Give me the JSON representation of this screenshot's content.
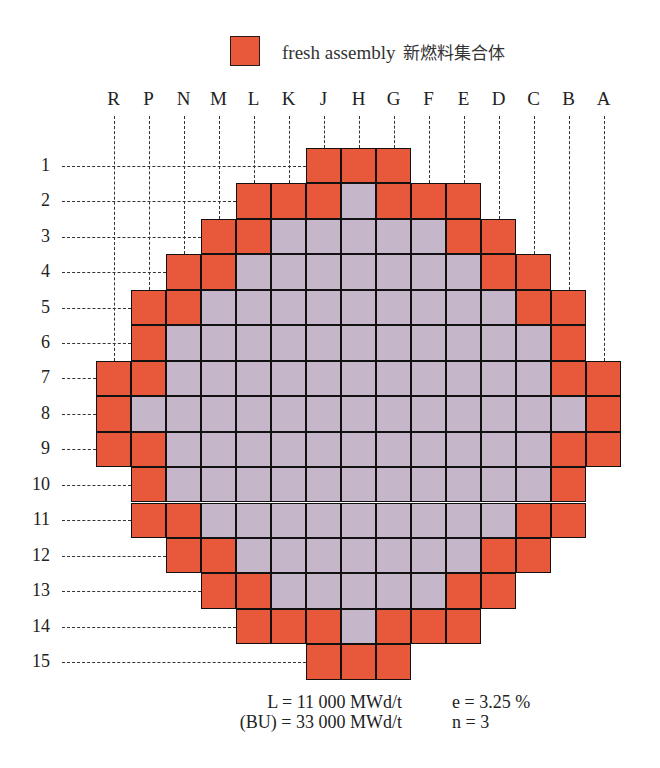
{
  "legend": {
    "swatch_color": "#e8583a",
    "label": "fresh assembly",
    "label_cjk": "新燃料集合体"
  },
  "colors": {
    "fresh": "#e8583a",
    "burned": "#c6b6c9",
    "grid_line": "#111111"
  },
  "columns": [
    "R",
    "P",
    "N",
    "M",
    "L",
    "K",
    "J",
    "H",
    "G",
    "F",
    "E",
    "D",
    "C",
    "B",
    "A"
  ],
  "rows": [
    "1",
    "2",
    "3",
    "4",
    "5",
    "6",
    "7",
    "8",
    "9",
    "10",
    "11",
    "12",
    "13",
    "14",
    "15"
  ],
  "core_map_legend": "F = fresh assembly, B = burned assembly, . = empty",
  "core_map": [
    "......FFF......",
    "....FFFBFFF....",
    "...FFBBBBBFF...",
    "..FFBBBBBBBFF..",
    ".FFBBBBBBBBBFF.",
    ".FBBBBBBBBBBBF.",
    "FFBBBBBBBBBBBFF",
    "FBBBBBBBBBBBBBF",
    "FFBBBBBBBBBBBFF",
    ".FBBBBBBBBBBBF.",
    ".FFBBBBBBBBBFF.",
    "..FFBBBBBBBFF..",
    "...FFBBBBBFF...",
    "....FFFBFFF....",
    "......FFF......"
  ],
  "parameters": {
    "line1_left": "L = 11 000 MWd/t",
    "line1_right": "e = 3.25 %",
    "line2_left": "(BU) = 33 000 MWd/t",
    "line2_right": "n = 3"
  }
}
